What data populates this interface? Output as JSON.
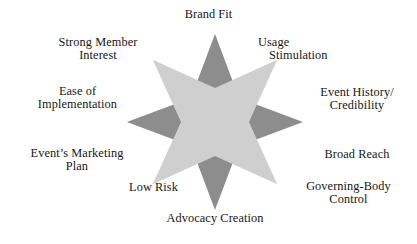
{
  "figure": {
    "name": "eight-point-star-criteria-diagram",
    "colors": {
      "background": "#ffffff",
      "star_back": "#8d8d8d",
      "star_front": "#cfcfcf",
      "text": "#161616"
    },
    "geometry": {
      "center_x": 215,
      "center_y": 122,
      "outer_radius": 88,
      "inner_radius": 34,
      "points": 8
    }
  },
  "labels": {
    "brand_fit": "Brand Fit",
    "usage_line1": "Usage",
    "usage_line2": "Stimulation",
    "event_history_line1": "Event History/",
    "event_history_line2": "Credibility",
    "broad_reach": "Broad Reach",
    "governing_line1": "Governing-Body",
    "governing_line2": "Control",
    "advocacy_creation": "Advocacy Creation",
    "low_risk": "Low Risk",
    "event_marketing_line1": "Event’s Marketing",
    "event_marketing_line2": "Plan",
    "ease_line1": "Ease of",
    "ease_line2": "Implementation",
    "strong_member_line1": "Strong Member",
    "strong_member_line2": "Interest"
  },
  "chart_data": {
    "type": "diagram",
    "title": "",
    "shape": "eight-pointed star (two overlaid four-point stars)",
    "categories": [
      "Brand Fit",
      "Usage Stimulation",
      "Event History/ Credibility",
      "Broad Reach",
      "Governing-Body Control",
      "Advocacy Creation",
      "Low Risk",
      "Event’s Marketing Plan",
      "Ease of Implementation",
      "Strong Member Interest"
    ],
    "point_directions": [
      "north",
      "northeast",
      "east",
      "southeast",
      "south",
      "southwest",
      "west",
      "northwest"
    ]
  }
}
